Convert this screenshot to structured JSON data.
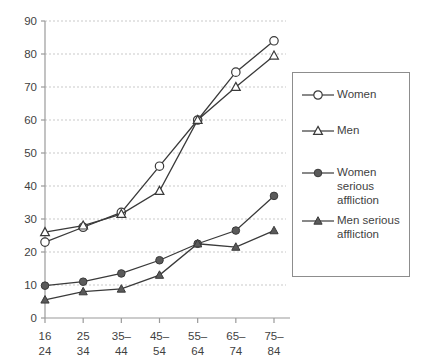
{
  "chart_data": {
    "type": "line",
    "title": "",
    "xlabel": "",
    "ylabel": "",
    "ylim": [
      0,
      90
    ],
    "ytick_values": [
      0,
      10,
      20,
      30,
      40,
      50,
      60,
      70,
      80,
      90
    ],
    "ytick_labels": [
      "0",
      "10",
      "20",
      "30",
      "40",
      "50",
      "60",
      "70",
      "80",
      "90"
    ],
    "grid": true,
    "grid_axis": "y",
    "legend_position": "right",
    "categories": [
      "16\n24",
      "25\n34",
      "35–\n44",
      "45–\n54",
      "55–\n64",
      "65–\n74",
      "75–\n84"
    ],
    "category_labels_top": [
      "16",
      "25",
      "35–",
      "45–",
      "55–",
      "65–",
      "75–"
    ],
    "category_labels_bottom": [
      "24",
      "34",
      "44",
      "54",
      "64",
      "74",
      "84"
    ],
    "series": [
      {
        "name": "Women",
        "marker": "open-circle",
        "values": [
          23,
          27.5,
          32,
          46,
          60,
          74.5,
          84
        ]
      },
      {
        "name": "Men",
        "marker": "open-triangle",
        "values": [
          26,
          28,
          31.5,
          38.5,
          60,
          70,
          79.5
        ]
      },
      {
        "name": "Women serious\naffliction",
        "marker": "filled-circle",
        "values": [
          9.8,
          11,
          13.5,
          17.5,
          22.5,
          26.5,
          37
        ]
      },
      {
        "name": "Men serious\naffliction",
        "marker": "filled-triangle",
        "values": [
          5.5,
          8,
          8.8,
          13,
          22.5,
          21.5,
          26.5
        ]
      }
    ]
  },
  "legend": {
    "items": [
      {
        "label": "Women",
        "marker": "open-circle"
      },
      {
        "label": "Men",
        "marker": "open-triangle"
      },
      {
        "label": "Women serious\naffliction",
        "marker": "filled-circle"
      },
      {
        "label": "Men serious\naffliction",
        "marker": "filled-triangle"
      }
    ]
  },
  "colors": {
    "line": "#3a3a3a",
    "axis": "#9a9a9a",
    "grid": "#c9c9c9",
    "text": "#3f3f3f",
    "marker_fill": "#ffffff",
    "marker_solid": "#5a5a5a",
    "legend_border": "#8d8d8d"
  }
}
